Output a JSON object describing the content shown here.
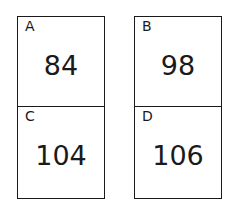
{
  "cards": [
    {
      "label": "A",
      "value": "84"
    },
    {
      "label": "B",
      "value": "98"
    },
    {
      "label": "C",
      "value": "104"
    },
    {
      "label": "D",
      "value": "106"
    }
  ]
}
